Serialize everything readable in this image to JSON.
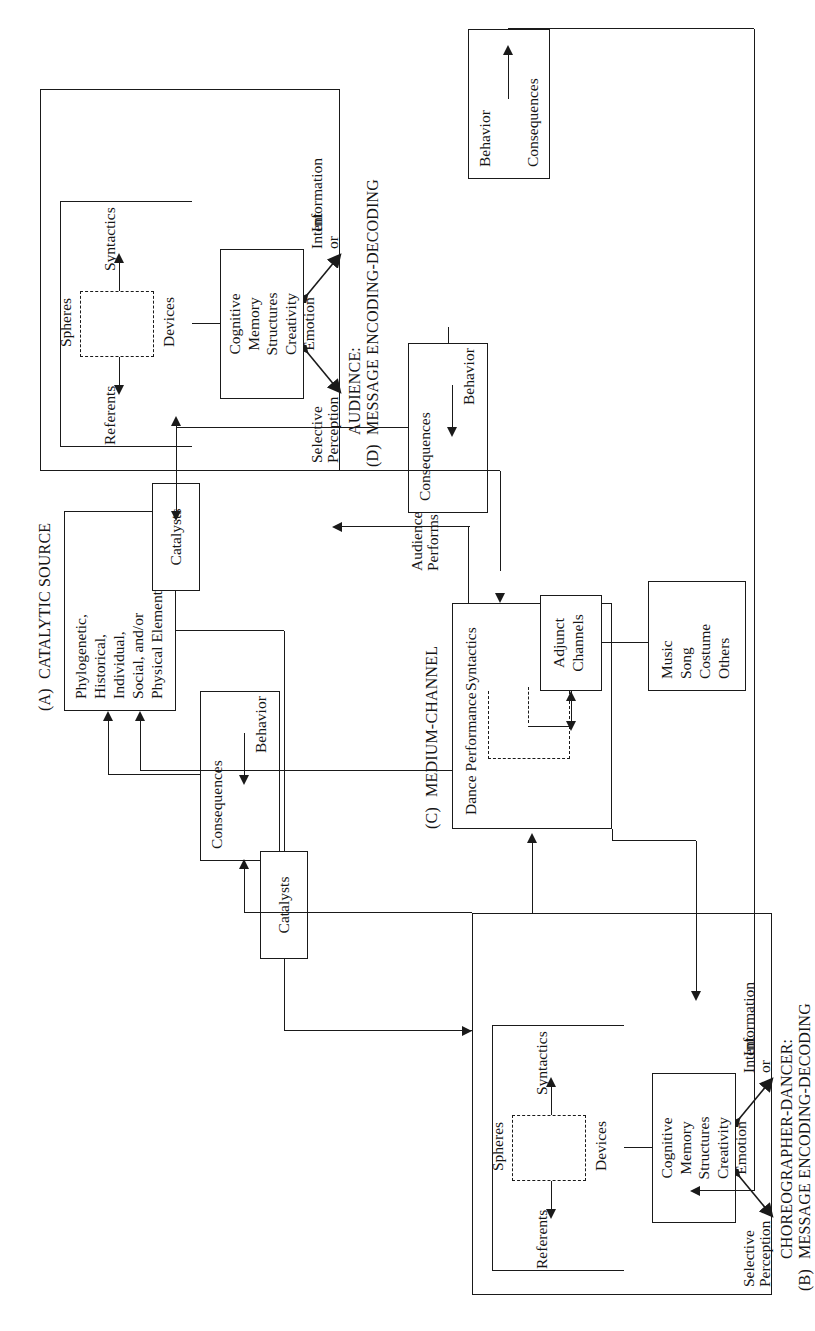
{
  "figure": {
    "orientation": "rotated-90-ccw"
  },
  "sections": {
    "a": {
      "tag": "(A)",
      "label": "CATALYTIC SOURCE"
    },
    "b": {
      "tag": "(B)",
      "label": "CHOREOGRAPHER-DANCER:",
      "label2": "MESSAGE ENCODING-DECODING"
    },
    "c": {
      "tag": "(C)",
      "label": "MEDIUM-CHANNEL"
    },
    "d": {
      "tag": "(D)",
      "label": "AUDIENCE:",
      "label2": "MESSAGE ENCODING-DECODING"
    }
  },
  "boxes": {
    "catalytic_source": {
      "lines": [
        "Phylogenetic,",
        "Historical,",
        "Individual,",
        "Social, and/or",
        "Physical Elements"
      ],
      "text": "Phylogenetic,\nHistorical,\nIndividual,\nSocial, and/or\nPhysical Elements"
    },
    "cognitive_top": {
      "lines": [
        "Cognitive",
        "Memory",
        "Structures",
        "Creativity",
        "Emotion"
      ],
      "text": "Cognitive\nMemory\nStructures\nCreativity\nEmotion"
    },
    "cognitive_bottom": {
      "lines": [
        "Cognitive",
        "Memory",
        "Structures",
        "Creativity",
        "Emotion"
      ],
      "text": "Cognitive\nMemory\nStructures\nCreativity\nEmotion"
    },
    "catalysts_top": {
      "label": "Catalysts"
    },
    "catalysts_bottom": {
      "label": "Catalysts"
    },
    "consequences_top": {
      "consequences": "Consequences",
      "behavior": "Behavior"
    },
    "consequences_bottom": {
      "consequences": "Consequences",
      "behavior": "Behavior"
    },
    "behavior_consequences_right": {
      "behavior": "Behavior",
      "consequences": "Consequences"
    },
    "adjunct_media": {
      "lines": [
        "Music",
        "Song",
        "Costume",
        "Others"
      ],
      "text": "Music\nSong\nCostume\nOthers"
    },
    "adjunct_channels": {
      "line1": "Adjunct",
      "line2": "Channels",
      "text": "Adjunct\nChannels"
    },
    "medium_channel": {
      "dance_performance": "Dance Performance",
      "syntactics": "Syntactics",
      "referents": "Referents"
    }
  },
  "encoding_labels": {
    "referents": "Referents",
    "syntactics": "Syntactics",
    "spheres": "Spheres",
    "devices": "Devices",
    "selective": "Selective",
    "perception": "Perception",
    "intent": "Intent",
    "or": "or",
    "information": "Information"
  },
  "flow_labels": {
    "audience": "Audience",
    "performs": "Performs"
  },
  "colors": {
    "ink": "#1a1a1a",
    "paper": "#ffffff"
  }
}
